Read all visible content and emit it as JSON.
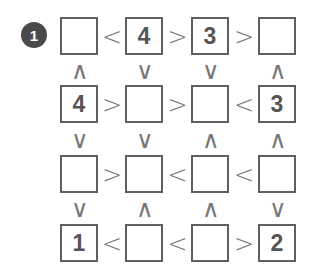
{
  "puzzle": {
    "number": "1",
    "grid": [
      [
        "",
        "4",
        "3",
        ""
      ],
      [
        "4",
        "",
        "",
        "3"
      ],
      [
        "",
        "",
        "",
        ""
      ],
      [
        "1",
        "",
        "",
        "2"
      ]
    ],
    "horizontal": [
      [
        "<",
        ">",
        ">"
      ],
      [
        ">",
        ">",
        "<"
      ],
      [
        ">",
        "<",
        "<"
      ],
      [
        "<",
        "<",
        ">"
      ]
    ],
    "vertical": [
      [
        "∧",
        "∨",
        "∨",
        "∧"
      ],
      [
        "∨",
        "∨",
        "∧",
        "∧"
      ],
      [
        "∨",
        "∧",
        "∧",
        "∨"
      ]
    ]
  }
}
